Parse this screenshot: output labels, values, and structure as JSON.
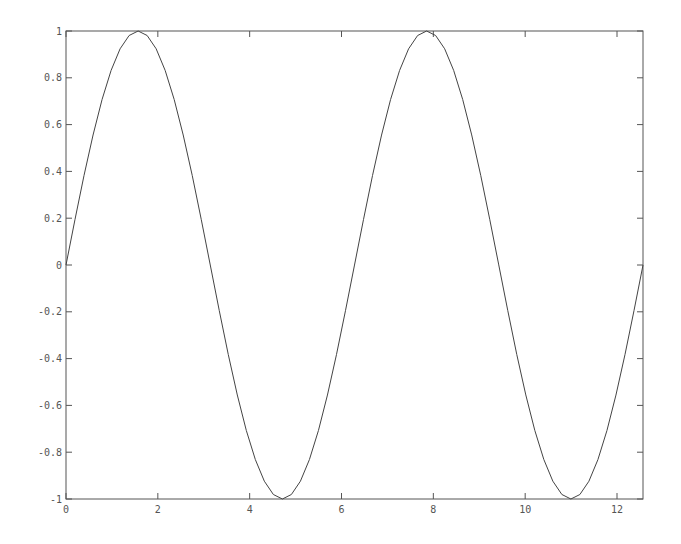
{
  "chart_data": {
    "type": "line",
    "title": "",
    "xlabel": "",
    "ylabel": "",
    "function": "sin(x)",
    "xlim": [
      0,
      12.566
    ],
    "ylim": [
      -1,
      1
    ],
    "grid": false,
    "legend": null,
    "x_ticks": [
      "0",
      "2",
      "4",
      "6",
      "8",
      "10",
      "12"
    ],
    "y_ticks": [
      "1",
      "0.8",
      "0.6",
      "0.4",
      "0.2",
      "0",
      "-0.2",
      "-0.4",
      "-0.6",
      "-0.8",
      "-1"
    ],
    "series": [
      {
        "name": "sin(x)",
        "color": "#444444",
        "x": [
          0,
          0.785,
          1.571,
          2.356,
          3.142,
          3.927,
          4.712,
          5.498,
          6.283,
          7.069,
          7.854,
          8.639,
          9.425,
          10.21,
          10.996,
          11.781,
          12.566
        ],
        "values": [
          0,
          0.707,
          1,
          0.707,
          0,
          -0.707,
          -1,
          -0.707,
          0,
          0.707,
          1,
          0.707,
          0,
          -0.707,
          -1,
          -0.707,
          0
        ]
      }
    ]
  },
  "colors": {
    "axis": "#555555",
    "line": "#444444",
    "background": "#ffffff"
  }
}
